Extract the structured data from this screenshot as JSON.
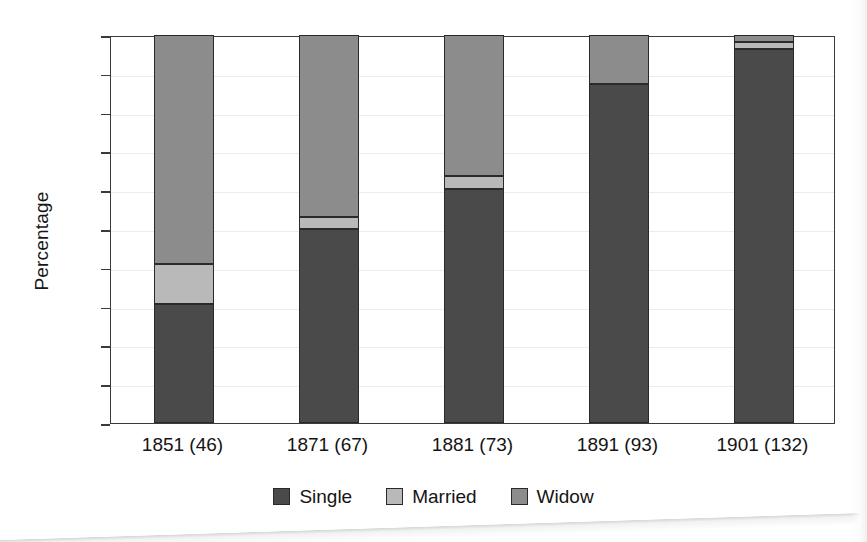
{
  "chart_data": {
    "type": "bar",
    "subtype": "stacked-bar",
    "title": "",
    "xlabel": "",
    "ylabel": "Percentage",
    "ylim": [
      0,
      100
    ],
    "yticks": [
      0,
      10,
      20,
      30,
      40,
      50,
      60,
      70,
      80,
      90,
      100
    ],
    "ytick_labels": [
      "0",
      "10",
      "20",
      "30",
      "40",
      "50",
      "60",
      "70",
      "80",
      "90",
      "100"
    ],
    "grid": true,
    "legend_position": "bottom-center",
    "categories": [
      "1851 (46)",
      "1871 (67)",
      "1881 (73)",
      "1891 (93)",
      "1901 (132)"
    ],
    "series": [
      {
        "name": "Single",
        "color": "#4a4a4a",
        "values": [
          30.7,
          50.0,
          60.3,
          87.4,
          96.4
        ]
      },
      {
        "name": "Married",
        "color": "#b9b9b9",
        "values": [
          10.4,
          3.1,
          3.4,
          0.0,
          1.8
        ]
      },
      {
        "name": "Widow",
        "color": "#8c8c8c",
        "values": [
          58.9,
          46.9,
          36.3,
          12.6,
          1.8
        ]
      }
    ]
  },
  "axis": {
    "y_title": "Percentage",
    "tick_labels": [
      "100",
      "90",
      "80",
      "70",
      "60",
      "50",
      "40",
      "30",
      "20",
      "10",
      "0"
    ]
  },
  "legend": {
    "items": [
      {
        "label": "Single",
        "color": "#4a4a4a"
      },
      {
        "label": "Married",
        "color": "#b9b9b9"
      },
      {
        "label": "Widow",
        "color": "#8c8c8c"
      }
    ]
  },
  "xaxis": {
    "labels": [
      "1851 (46)",
      "1871 (67)",
      "1881 (73)",
      "1891 (93)",
      "1901 (132)"
    ]
  }
}
